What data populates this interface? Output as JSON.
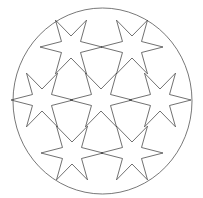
{
  "diagram": {
    "title": "",
    "circle": {
      "cx": 102.5,
      "cy": 101,
      "rx": 89.5,
      "ry": 93,
      "stroke": "#555555"
    },
    "star_style": {
      "points": 6,
      "outer_radius": 31,
      "inner_radius": 11,
      "rotation_deg": 0,
      "stroke": "#333333"
    },
    "stars": [
      {
        "name": "star-top-left",
        "cx": 71,
        "cy": 47
      },
      {
        "name": "star-top-right",
        "cx": 132,
        "cy": 47
      },
      {
        "name": "star-middle-left",
        "cx": 42,
        "cy": 100
      },
      {
        "name": "star-center",
        "cx": 101,
        "cy": 100
      },
      {
        "name": "star-middle-right",
        "cx": 160,
        "cy": 100
      },
      {
        "name": "star-bottom-left",
        "cx": 72,
        "cy": 153
      },
      {
        "name": "star-bottom-right",
        "cx": 132,
        "cy": 153
      }
    ]
  }
}
